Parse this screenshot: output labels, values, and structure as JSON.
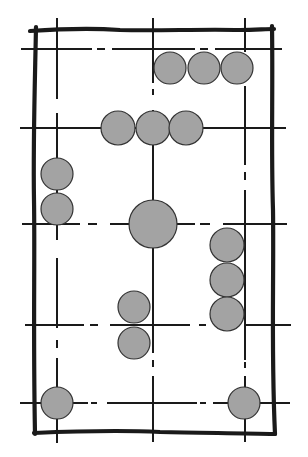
{
  "diagram": {
    "type": "structural-grid-sketch",
    "colors": {
      "background": "#ffffff",
      "line": "#1a1a1a",
      "circle_fill": "#a3a3a3",
      "circle_stroke": "#333333"
    },
    "border": {
      "x": 35,
      "y": 30,
      "width": 237,
      "height": 404
    },
    "grid": {
      "vertical_x": [
        57,
        153,
        245
      ],
      "horizontal_y": [
        49,
        128,
        224,
        325,
        403
      ]
    },
    "circles": [
      {
        "group": "top-row",
        "cx": 170,
        "cy": 68,
        "r": 16
      },
      {
        "group": "top-row",
        "cx": 204,
        "cy": 68,
        "r": 16
      },
      {
        "group": "top-row",
        "cx": 237,
        "cy": 68,
        "r": 16
      },
      {
        "group": "second-row",
        "cx": 118,
        "cy": 128,
        "r": 17
      },
      {
        "group": "second-row",
        "cx": 153,
        "cy": 128,
        "r": 17
      },
      {
        "group": "second-row",
        "cx": 186,
        "cy": 128,
        "r": 17
      },
      {
        "group": "left-stack",
        "cx": 57,
        "cy": 174,
        "r": 16
      },
      {
        "group": "left-stack",
        "cx": 57,
        "cy": 209,
        "r": 16
      },
      {
        "group": "center-large",
        "cx": 153,
        "cy": 224,
        "r": 24
      },
      {
        "group": "right-stack",
        "cx": 227,
        "cy": 245,
        "r": 17
      },
      {
        "group": "right-stack",
        "cx": 227,
        "cy": 280,
        "r": 17
      },
      {
        "group": "right-stack",
        "cx": 227,
        "cy": 314,
        "r": 17
      },
      {
        "group": "lower-center-stack",
        "cx": 134,
        "cy": 307,
        "r": 16
      },
      {
        "group": "lower-center-stack",
        "cx": 134,
        "cy": 343,
        "r": 16
      },
      {
        "group": "bottom-corner",
        "cx": 57,
        "cy": 403,
        "r": 16
      },
      {
        "group": "bottom-corner",
        "cx": 244,
        "cy": 403,
        "r": 16
      }
    ]
  }
}
